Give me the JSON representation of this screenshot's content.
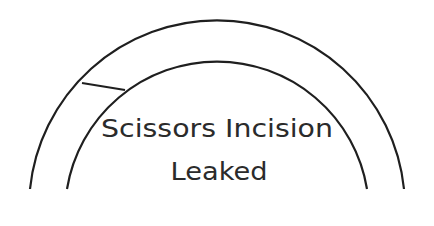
{
  "diagram": {
    "title_lines": [
      "Scissors Incision",
      "Leaked"
    ],
    "colors": {
      "stroke": "#1f1f1f",
      "text": "#2b2b2b",
      "background": "#ffffff"
    },
    "shapes": {
      "outer_arc": "semicircular arc",
      "inner_arc": "semicircular arc",
      "divider": "short segment connecting outer and inner arcs on upper-left"
    }
  }
}
